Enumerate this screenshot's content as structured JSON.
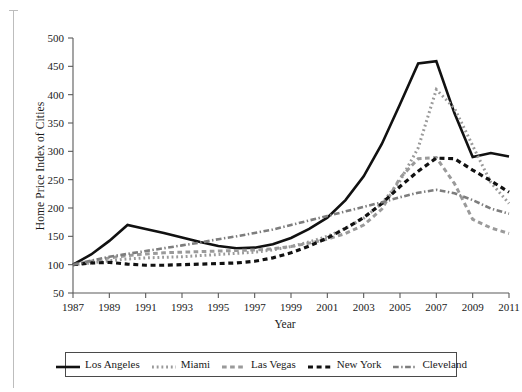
{
  "chart_data": {
    "type": "line",
    "title": "",
    "xlabel": "Year",
    "ylabel": "Home Price Index of Cities",
    "xlim": [
      1987,
      2011
    ],
    "ylim": [
      50,
      500
    ],
    "xticks": [
      1987,
      1989,
      1991,
      1993,
      1995,
      1997,
      1999,
      2001,
      2003,
      2005,
      2007,
      2009,
      2011
    ],
    "yticks": [
      50,
      100,
      150,
      200,
      250,
      300,
      350,
      400,
      450,
      500
    ],
    "grid": false,
    "legend_position": "bottom",
    "x": [
      1987,
      1988,
      1989,
      1990,
      1991,
      1992,
      1993,
      1994,
      1995,
      1996,
      1997,
      1998,
      1999,
      2000,
      2001,
      2002,
      2003,
      2004,
      2005,
      2006,
      2007,
      2008,
      2009,
      2010,
      2011
    ],
    "series": [
      {
        "name": "Los Angeles",
        "color": "#111111",
        "style": "solid",
        "width": 2.6,
        "values": [
          100,
          118,
          142,
          170,
          163,
          156,
          148,
          140,
          133,
          129,
          130,
          136,
          147,
          163,
          183,
          214,
          256,
          313,
          383,
          455,
          459,
          367,
          290,
          297,
          291
        ]
      },
      {
        "name": "Miami",
        "color": "#9a9a9a",
        "style": "dotted",
        "width": 3.0,
        "values": [
          100,
          103,
          107,
          110,
          112,
          113,
          114,
          116,
          118,
          120,
          122,
          126,
          132,
          140,
          150,
          164,
          182,
          208,
          248,
          306,
          409,
          376,
          310,
          245,
          208
        ]
      },
      {
        "name": "Las Vegas",
        "color": "#9a9a9a",
        "style": "dashed",
        "width": 3.0,
        "values": [
          100,
          106,
          112,
          116,
          119,
          121,
          122,
          123,
          124,
          125,
          126,
          128,
          132,
          138,
          145,
          155,
          170,
          198,
          253,
          287,
          289,
          243,
          180,
          165,
          155
        ]
      },
      {
        "name": "New York",
        "color": "#111111",
        "style": "dashed",
        "width": 3.2,
        "values": [
          100,
          103,
          104,
          101,
          99,
          99,
          100,
          101,
          102,
          103,
          106,
          112,
          121,
          133,
          147,
          164,
          183,
          208,
          238,
          265,
          288,
          287,
          267,
          248,
          228
        ]
      },
      {
        "name": "Cleveland",
        "color": "#7d7d7d",
        "style": "dashdot",
        "width": 2.6,
        "values": [
          100,
          107,
          114,
          119,
          124,
          129,
          134,
          139,
          145,
          150,
          156,
          162,
          170,
          178,
          186,
          194,
          202,
          210,
          219,
          227,
          232,
          226,
          214,
          199,
          190
        ]
      }
    ]
  },
  "legend": {
    "items": [
      {
        "label": "Los Angeles",
        "key": "los-angeles"
      },
      {
        "label": "Miami",
        "key": "miami"
      },
      {
        "label": "Las Vegas",
        "key": "las-vegas"
      },
      {
        "label": "New York",
        "key": "new-york"
      },
      {
        "label": "Cleveland",
        "key": "cleveland"
      }
    ]
  }
}
